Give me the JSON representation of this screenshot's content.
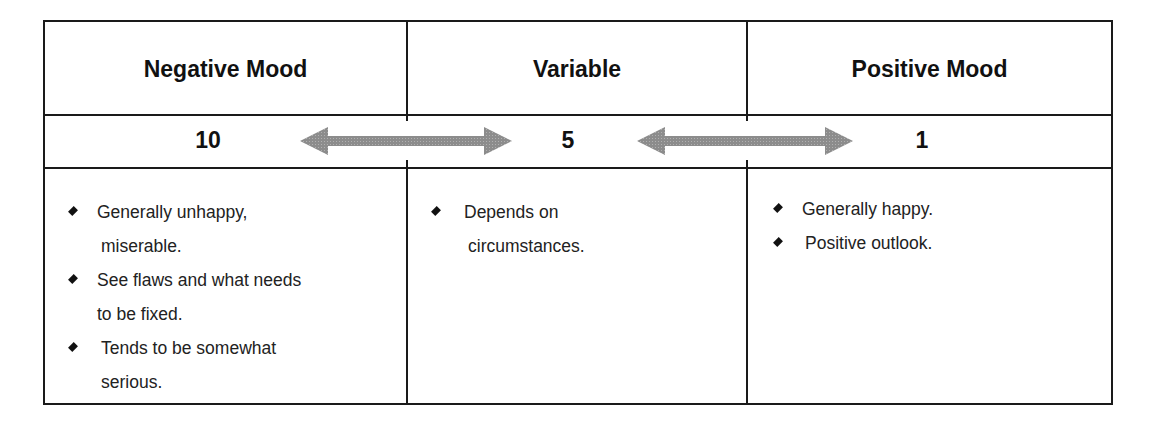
{
  "table": {
    "headers": [
      "Negative Mood",
      "Variable",
      "Positive Mood"
    ],
    "scale": {
      "left_value": "10",
      "middle_value": "5",
      "right_value": "1",
      "arrow_color": "#8a8a8a"
    },
    "columns": [
      {
        "items": [
          {
            "line1": "Generally unhappy,",
            "line2": "miserable."
          },
          {
            "line1": "See flaws and what needs",
            "line2": "to be fixed."
          },
          {
            "line1": "Tends to be somewhat",
            "line2": "serious."
          }
        ]
      },
      {
        "items": [
          {
            "line1": "Depends on",
            "line2": "circumstances."
          }
        ]
      },
      {
        "items": [
          {
            "line1": "Generally happy."
          },
          {
            "line1": "Positive outlook."
          }
        ]
      }
    ],
    "bullet_icon": "diamond-bullet"
  }
}
